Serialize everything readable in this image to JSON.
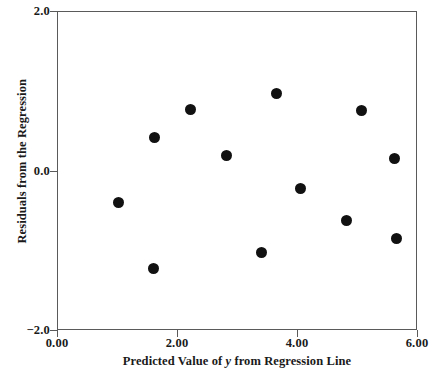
{
  "chart_data": {
    "type": "scatter",
    "title": "",
    "subtitle": "",
    "xlabel_prefix": "Predicted Value of ",
    "xlabel_italic": "y",
    "xlabel_suffix": " from Regression Line",
    "xlabel": "Predicted Value of y from Regression Line",
    "ylabel": "Residuals from the Regression",
    "xlim": [
      0.0,
      6.0
    ],
    "ylim": [
      -2.0,
      2.0
    ],
    "xticks": [
      0.0,
      2.0,
      4.0,
      6.0
    ],
    "xtick_labels": [
      "0.00",
      "2.00",
      "4.00",
      "6.00"
    ],
    "yticks": [
      2.0,
      0.0,
      -2.0
    ],
    "ytick_labels": [
      "2.0",
      "0.0",
      "−2.0"
    ],
    "grid": false,
    "legend": null,
    "marker": "filled-circle",
    "marker_color": "#111111",
    "marker_size_px": 11,
    "frame_color": "#5a5a5a",
    "background_color": "#ffffff",
    "n_points": 12,
    "x": [
      1.02,
      1.6,
      1.63,
      2.22,
      2.82,
      3.4,
      3.65,
      4.05,
      4.83,
      5.07,
      5.63,
      5.65
    ],
    "y": [
      -0.4,
      -1.23,
      0.41,
      0.77,
      0.19,
      -1.03,
      0.97,
      -0.23,
      -0.63,
      0.75,
      0.15,
      -0.85
    ],
    "points": [
      {
        "x": 1.02,
        "y": -0.4
      },
      {
        "x": 1.6,
        "y": -1.23
      },
      {
        "x": 1.63,
        "y": 0.41
      },
      {
        "x": 2.22,
        "y": 0.77
      },
      {
        "x": 2.82,
        "y": 0.19
      },
      {
        "x": 3.4,
        "y": -1.03
      },
      {
        "x": 3.65,
        "y": 0.97
      },
      {
        "x": 4.05,
        "y": -0.23
      },
      {
        "x": 4.83,
        "y": -0.63
      },
      {
        "x": 5.07,
        "y": 0.75
      },
      {
        "x": 5.63,
        "y": 0.15
      },
      {
        "x": 5.65,
        "y": -0.85
      }
    ]
  }
}
